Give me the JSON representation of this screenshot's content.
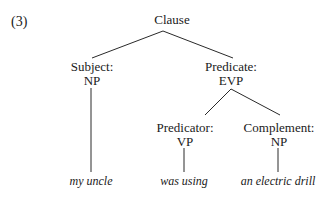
{
  "example_number": "(3)",
  "tree": {
    "root": {
      "label": "Clause"
    },
    "subject": {
      "function": "Subject:",
      "category": "NP",
      "leaf": "my uncle"
    },
    "predicate": {
      "function": "Predicate:",
      "category": "EVP"
    },
    "predicator": {
      "function": "Predicator:",
      "category": "VP",
      "leaf": "was using"
    },
    "complement": {
      "function": "Complement:",
      "category": "NP",
      "leaf": "an electric drill"
    }
  }
}
